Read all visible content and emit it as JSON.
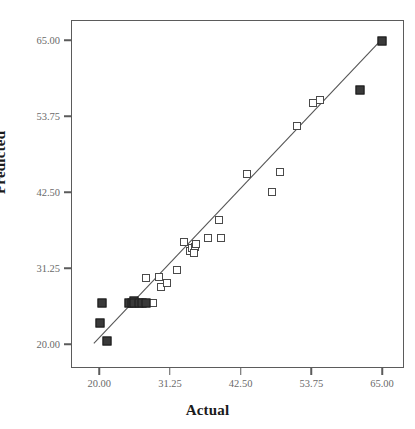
{
  "chart_data": {
    "type": "scatter",
    "title": "",
    "xlabel": "Actual",
    "ylabel": "Predicted",
    "xlim": [
      15.5,
      68.5
    ],
    "ylim": [
      16.5,
      68.0
    ],
    "xticks": [
      "20.00",
      "31.25",
      "42.50",
      "53.75",
      "65.00"
    ],
    "yticks": [
      "20.00",
      "31.25",
      "42.50",
      "53.75",
      "65.00"
    ],
    "xtick_values": [
      20.0,
      31.25,
      42.5,
      53.75,
      65.0
    ],
    "ytick_values": [
      20.0,
      31.25,
      42.5,
      53.75,
      65.0
    ],
    "grid": false,
    "legend": false,
    "series": [
      {
        "name": "open-markers",
        "marker": "open-square",
        "points": [
          [
            27.3,
            29.9
          ],
          [
            27.3,
            26.2
          ],
          [
            28.4,
            26.2
          ],
          [
            29.3,
            30.1
          ],
          [
            29.6,
            28.6
          ],
          [
            30.6,
            29.2
          ],
          [
            32.2,
            31.1
          ],
          [
            33.3,
            35.3
          ],
          [
            34.3,
            33.9
          ],
          [
            34.6,
            34.4
          ],
          [
            35.0,
            34.6
          ],
          [
            35.3,
            35.0
          ],
          [
            34.9,
            33.6
          ],
          [
            37.2,
            35.9
          ],
          [
            38.9,
            38.6
          ],
          [
            39.2,
            35.9
          ],
          [
            43.3,
            45.3
          ],
          [
            47.4,
            42.7
          ],
          [
            48.6,
            45.6
          ],
          [
            51.3,
            52.4
          ],
          [
            53.8,
            55.8
          ],
          [
            55.0,
            56.3
          ]
        ]
      },
      {
        "name": "filled-markers",
        "marker": "filled-square",
        "points": [
          [
            20.0,
            23.3
          ],
          [
            20.3,
            26.2
          ],
          [
            21.0,
            20.7
          ],
          [
            24.6,
            26.2
          ],
          [
            25.0,
            26.2
          ],
          [
            25.3,
            26.6
          ],
          [
            25.4,
            26.2
          ],
          [
            26.1,
            26.2
          ],
          [
            26.7,
            26.2
          ],
          [
            27.2,
            26.2
          ],
          [
            61.3,
            57.8
          ],
          [
            64.9,
            65.1
          ]
        ]
      }
    ],
    "fit_line": {
      "name": "regression-line",
      "x0": 19.0,
      "y0": 20.0,
      "x1": 64.9,
      "y1": 65.1
    }
  }
}
